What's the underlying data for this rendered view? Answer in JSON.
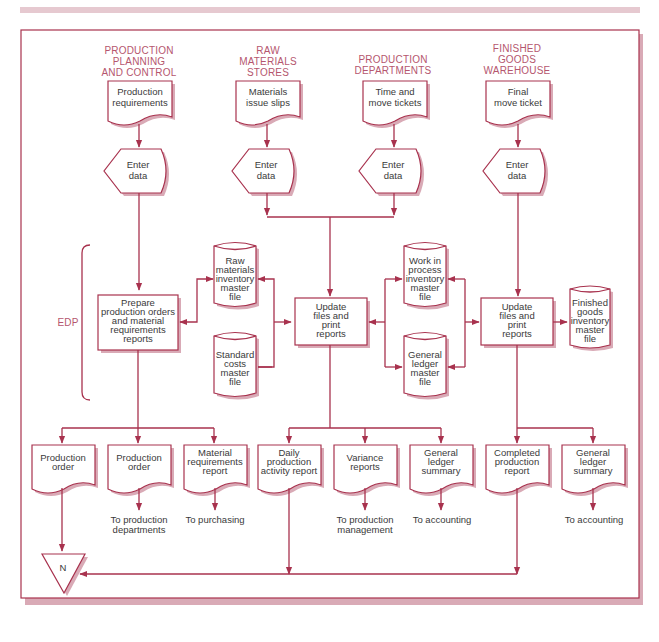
{
  "colors": {
    "line": "#a8324e",
    "header_text": "#b5566e",
    "body_text": "#3a3a3a",
    "shadow": "#d9aab6",
    "top_band": "#e6c9d0"
  },
  "headers": {
    "ppc": [
      "PRODUCTION",
      "PLANNING",
      "AND CONTROL"
    ],
    "rms": [
      "RAW",
      "MATERIALS",
      "STORES"
    ],
    "pd": [
      "PRODUCTION",
      "DEPARTMENTS"
    ],
    "fgw": [
      "FINISHED",
      "GOODS",
      "WAREHOUSE"
    ]
  },
  "source_docs": {
    "ppc": [
      "Production",
      "requirements"
    ],
    "rms": [
      "Materials",
      "issue slips"
    ],
    "pd": [
      "Time and",
      "move tickets"
    ],
    "fgw": [
      "Final",
      "move ticket"
    ]
  },
  "input_label": [
    "Enter",
    "data"
  ],
  "edp_label": "EDP",
  "processes": {
    "prepare": [
      "Prepare",
      "production orders",
      "and material",
      "requirements",
      "reports"
    ],
    "update1": [
      "Update",
      "files and",
      "print",
      "reports"
    ],
    "update2": [
      "Update",
      "files and",
      "print",
      "reports"
    ]
  },
  "files": {
    "raw_materials": [
      "Raw",
      "materials",
      "inventory",
      "master",
      "file"
    ],
    "standard_costs": [
      "Standard",
      "costs",
      "master",
      "file"
    ],
    "wip": [
      "Work in",
      "process",
      "inventory",
      "master",
      "file"
    ],
    "general_ledger": [
      "General",
      "ledger",
      "master",
      "file"
    ],
    "finished_goods": [
      "Finished",
      "goods",
      "inventory",
      "master",
      "file"
    ]
  },
  "output_docs": {
    "production_order_1": [
      "Production",
      "order"
    ],
    "production_order_2": [
      "Production",
      "order"
    ],
    "material_req": [
      "Material",
      "requirements",
      "report"
    ],
    "daily_activity": [
      "Daily",
      "production",
      "activity report"
    ],
    "variance": [
      "Variance",
      "reports"
    ],
    "gl_summary_1": [
      "General",
      "ledger",
      "summary"
    ],
    "completed_prod": [
      "Completed",
      "production",
      "report"
    ],
    "gl_summary_2": [
      "General",
      "ledger",
      "summary"
    ]
  },
  "destinations": {
    "to_prod_depts": [
      "To production",
      "departments"
    ],
    "to_purchasing": [
      "To purchasing"
    ],
    "to_prod_mgmt": [
      "To production",
      "management"
    ],
    "to_accounting_1": [
      "To accounting"
    ],
    "to_accounting_2": [
      "To accounting"
    ]
  },
  "file_symbol": "N"
}
